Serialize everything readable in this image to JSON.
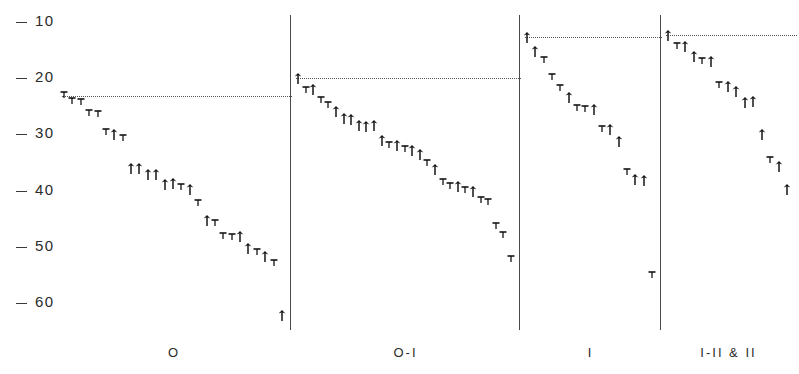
{
  "chart_data": {
    "type": "scatter",
    "title": "",
    "subtitle": "",
    "xlabel": "",
    "ylabel": "",
    "ylim": [
      8,
      66
    ],
    "y_inverted": true,
    "grid": false,
    "legend_position": "none",
    "y_ticks": [
      10,
      20,
      30,
      40,
      50,
      60
    ],
    "y_tick_labels": [
      "10",
      "20",
      "30",
      "40",
      "50",
      "60"
    ],
    "x_categories": [
      "O",
      "O-I",
      "I",
      "I-II & II"
    ],
    "marker_types": [
      "up-arrow",
      "down-tick"
    ],
    "panel_reference_values": [
      23.2,
      20.0,
      12.6,
      12.3
    ],
    "series": [
      {
        "name": "O",
        "label": "O",
        "n": 28,
        "reference_value": 23.2,
        "points": [
          {
            "i": 1,
            "value": 23.2,
            "marker": "down-tick"
          },
          {
            "i": 2,
            "value": 24.3,
            "marker": "down-tick"
          },
          {
            "i": 3,
            "value": 24.4,
            "marker": "down-tick"
          },
          {
            "i": 4,
            "value": 26.4,
            "marker": "down-tick"
          },
          {
            "i": 5,
            "value": 26.5,
            "marker": "down-tick"
          },
          {
            "i": 6,
            "value": 29.8,
            "marker": "down-tick"
          },
          {
            "i": 7,
            "value": 29.9,
            "marker": "up-arrow"
          },
          {
            "i": 8,
            "value": 30.9,
            "marker": "down-tick"
          },
          {
            "i": 9,
            "value": 36.0,
            "marker": "up-arrow"
          },
          {
            "i": 10,
            "value": 35.9,
            "marker": "up-arrow"
          },
          {
            "i": 11,
            "value": 37.0,
            "marker": "up-arrow"
          },
          {
            "i": 12,
            "value": 37.1,
            "marker": "up-arrow"
          },
          {
            "i": 13,
            "value": 38.9,
            "marker": "up-arrow"
          },
          {
            "i": 14,
            "value": 38.6,
            "marker": "up-arrow"
          },
          {
            "i": 15,
            "value": 39.6,
            "marker": "down-tick"
          },
          {
            "i": 16,
            "value": 39.7,
            "marker": "up-arrow"
          },
          {
            "i": 17,
            "value": 42.4,
            "marker": "down-tick"
          },
          {
            "i": 18,
            "value": 45.3,
            "marker": "up-arrow"
          },
          {
            "i": 19,
            "value": 46.0,
            "marker": "down-tick"
          },
          {
            "i": 20,
            "value": 48.3,
            "marker": "down-tick"
          },
          {
            "i": 21,
            "value": 48.4,
            "marker": "down-tick"
          },
          {
            "i": 22,
            "value": 48.1,
            "marker": "up-arrow"
          },
          {
            "i": 23,
            "value": 50.2,
            "marker": "up-arrow"
          },
          {
            "i": 24,
            "value": 51.1,
            "marker": "down-tick"
          },
          {
            "i": 25,
            "value": 51.7,
            "marker": "up-arrow"
          },
          {
            "i": 26,
            "value": 53.0,
            "marker": "down-tick"
          },
          {
            "i": 27,
            "value": 62.2,
            "marker": "up-arrow"
          }
        ]
      },
      {
        "name": "O-I",
        "label": "O-I",
        "n": 38,
        "reference_value": 20.0,
        "points": [
          {
            "i": 1,
            "value": 20.0,
            "marker": "up-arrow"
          },
          {
            "i": 2,
            "value": 22.2,
            "marker": "down-tick"
          },
          {
            "i": 3,
            "value": 22.0,
            "marker": "up-arrow"
          },
          {
            "i": 4,
            "value": 24.0,
            "marker": "down-tick"
          },
          {
            "i": 5,
            "value": 24.9,
            "marker": "down-tick"
          },
          {
            "i": 6,
            "value": 25.8,
            "marker": "up-arrow"
          },
          {
            "i": 7,
            "value": 27.1,
            "marker": "up-arrow"
          },
          {
            "i": 8,
            "value": 27.3,
            "marker": "up-arrow"
          },
          {
            "i": 9,
            "value": 28.4,
            "marker": "up-arrow"
          },
          {
            "i": 10,
            "value": 28.5,
            "marker": "up-arrow"
          },
          {
            "i": 11,
            "value": 28.3,
            "marker": "up-arrow"
          },
          {
            "i": 12,
            "value": 31.0,
            "marker": "up-arrow"
          },
          {
            "i": 13,
            "value": 32.0,
            "marker": "down-tick"
          },
          {
            "i": 14,
            "value": 31.9,
            "marker": "up-arrow"
          },
          {
            "i": 15,
            "value": 32.8,
            "marker": "down-tick"
          },
          {
            "i": 16,
            "value": 32.7,
            "marker": "up-arrow"
          },
          {
            "i": 17,
            "value": 33.5,
            "marker": "up-arrow"
          },
          {
            "i": 18,
            "value": 35.2,
            "marker": "down-tick"
          },
          {
            "i": 19,
            "value": 36.2,
            "marker": "up-arrow"
          },
          {
            "i": 20,
            "value": 38.6,
            "marker": "down-tick"
          },
          {
            "i": 21,
            "value": 39.4,
            "marker": "down-tick"
          },
          {
            "i": 22,
            "value": 39.2,
            "marker": "up-arrow"
          },
          {
            "i": 23,
            "value": 40.1,
            "marker": "down-tick"
          },
          {
            "i": 24,
            "value": 40.0,
            "marker": "up-arrow"
          },
          {
            "i": 25,
            "value": 41.8,
            "marker": "down-tick"
          },
          {
            "i": 26,
            "value": 42.2,
            "marker": "down-tick"
          },
          {
            "i": 27,
            "value": 46.5,
            "marker": "down-tick"
          },
          {
            "i": 28,
            "value": 48.0,
            "marker": "down-tick"
          },
          {
            "i": 29,
            "value": 52.3,
            "marker": "down-tick"
          }
        ]
      },
      {
        "name": "I",
        "label": "I",
        "n": 22,
        "reference_value": 12.6,
        "points": [
          {
            "i": 1,
            "value": 12.6,
            "marker": "up-arrow"
          },
          {
            "i": 2,
            "value": 15.2,
            "marker": "up-arrow"
          },
          {
            "i": 3,
            "value": 17.0,
            "marker": "down-tick"
          },
          {
            "i": 4,
            "value": 20.0,
            "marker": "down-tick"
          },
          {
            "i": 5,
            "value": 22.0,
            "marker": "down-tick"
          },
          {
            "i": 6,
            "value": 23.3,
            "marker": "up-arrow"
          },
          {
            "i": 7,
            "value": 25.5,
            "marker": "down-tick"
          },
          {
            "i": 8,
            "value": 25.6,
            "marker": "down-tick"
          },
          {
            "i": 9,
            "value": 25.4,
            "marker": "up-arrow"
          },
          {
            "i": 10,
            "value": 29.2,
            "marker": "down-tick"
          },
          {
            "i": 11,
            "value": 29.0,
            "marker": "up-arrow"
          },
          {
            "i": 12,
            "value": 31.2,
            "marker": "up-arrow"
          },
          {
            "i": 13,
            "value": 36.8,
            "marker": "down-tick"
          },
          {
            "i": 14,
            "value": 38.0,
            "marker": "up-arrow"
          },
          {
            "i": 15,
            "value": 38.1,
            "marker": "up-arrow"
          },
          {
            "i": 16,
            "value": 55.2,
            "marker": "down-tick"
          }
        ]
      },
      {
        "name": "I-II & II",
        "label": "I-II & II",
        "n": 16,
        "reference_value": 12.3,
        "points": [
          {
            "i": 1,
            "value": 12.3,
            "marker": "up-arrow"
          },
          {
            "i": 2,
            "value": 14.4,
            "marker": "down-tick"
          },
          {
            "i": 3,
            "value": 14.2,
            "marker": "up-arrow"
          },
          {
            "i": 4,
            "value": 16.0,
            "marker": "up-arrow"
          },
          {
            "i": 5,
            "value": 17.2,
            "marker": "down-tick"
          },
          {
            "i": 6,
            "value": 17.0,
            "marker": "up-arrow"
          },
          {
            "i": 7,
            "value": 21.4,
            "marker": "down-tick"
          },
          {
            "i": 8,
            "value": 21.3,
            "marker": "up-arrow"
          },
          {
            "i": 9,
            "value": 22.3,
            "marker": "up-arrow"
          },
          {
            "i": 10,
            "value": 24.2,
            "marker": "up-arrow"
          },
          {
            "i": 11,
            "value": 24.1,
            "marker": "up-arrow"
          },
          {
            "i": 12,
            "value": 30.0,
            "marker": "up-arrow"
          },
          {
            "i": 13,
            "value": 34.8,
            "marker": "down-tick"
          },
          {
            "i": 14,
            "value": 35.6,
            "marker": "up-arrow"
          },
          {
            "i": 15,
            "value": 39.8,
            "marker": "up-arrow"
          }
        ]
      }
    ]
  },
  "style": {
    "ink_color": "#1a1a1a",
    "axis_color": "#3a3a3a",
    "divider_color": "#4a4a4a",
    "reference_line_color": "#555555",
    "background": "#ffffff"
  }
}
